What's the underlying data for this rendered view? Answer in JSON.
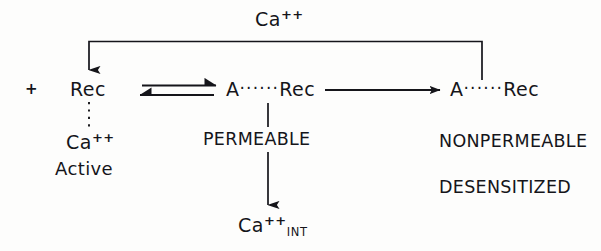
{
  "diagram": {
    "background_color": "#fdfdfc",
    "ink_color": "#15151a",
    "top_label": {
      "formula": "Ca",
      "charge": "++"
    },
    "left_plus": "+",
    "nodes": {
      "free_receptor": "Rec",
      "calcium_active": {
        "formula": "Ca",
        "charge": "++"
      },
      "calcium_active_state": "Active",
      "bound_complex": {
        "agonist": "A",
        "link": "······",
        "receptor": "Rec"
      },
      "bound_state": "PERMEABLE",
      "internal_calcium": {
        "formula": "Ca",
        "charge": "++",
        "subscript": "INT"
      },
      "desensitized_complex": {
        "agonist": "A",
        "link": "······",
        "receptor": "Rec"
      },
      "desensitized_state_1": "NONPERMEABLE",
      "desensitized_state_2": "DESENSITIZED"
    }
  }
}
